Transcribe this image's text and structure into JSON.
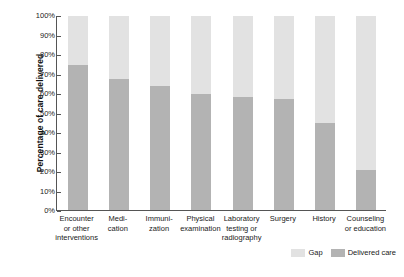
{
  "chart_data": {
    "type": "bar",
    "stacked": true,
    "title": "",
    "subtitle": "",
    "xlabel": "",
    "ylabel": "Percentage of care delivered",
    "ylim": [
      0,
      100
    ],
    "ytick_labels": [
      "100%",
      "90%",
      "80%",
      "70%",
      "60%",
      "50%",
      "40%",
      "30%",
      "20%",
      "10%",
      "0%"
    ],
    "ytick_values": [
      100,
      90,
      80,
      70,
      60,
      50,
      40,
      30,
      20,
      10,
      0
    ],
    "grid": false,
    "legend_position": "bottom-right",
    "categories": [
      "Encounter or other interventions",
      "Medication",
      "Immunization",
      "Physical examination",
      "Laboratory testing or radiography",
      "Surgery",
      "History",
      "Counseling or education"
    ],
    "category_lines": [
      [
        "Encounter",
        "or other",
        "interventions"
      ],
      [
        "Medi-",
        "cation"
      ],
      [
        "Immuni-",
        "zation"
      ],
      [
        "Physical",
        "examination"
      ],
      [
        "Laboratory",
        "testing or",
        "radiography"
      ],
      [
        "Surgery"
      ],
      [
        "History"
      ],
      [
        "Counseling",
        "or education"
      ]
    ],
    "series": [
      {
        "name": "Delivered care",
        "color": "#b3b3b3",
        "values": [
          75,
          67.5,
          64,
          60,
          58,
          57,
          45,
          20.5
        ]
      },
      {
        "name": "Gap",
        "color": "#e2e2e2",
        "values": [
          25,
          32.5,
          36,
          40,
          42,
          43,
          55,
          79.5
        ]
      }
    ]
  },
  "legend": {
    "items": [
      {
        "label": "Gap",
        "color": "#e2e2e2"
      },
      {
        "label": "Delivered care",
        "color": "#b3b3b3"
      }
    ]
  },
  "colors": {
    "gap": "#e2e2e2",
    "delivered": "#b3b3b3",
    "axis": "#555555",
    "text": "#1a1a1a",
    "background": "#ffffff"
  }
}
